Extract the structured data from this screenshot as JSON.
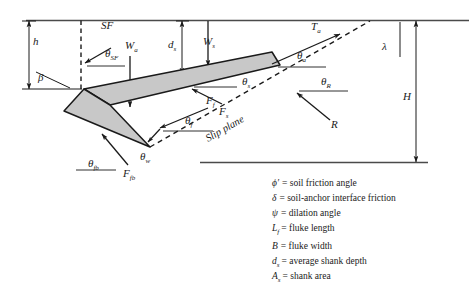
{
  "figure": {
    "title_hidden": "",
    "colors": {
      "anchor_fill": "#c8c8c8",
      "line": "#1a1a1a",
      "text": "#1a1a1a",
      "background": "#ffffff"
    },
    "boundaries": {
      "seabed_line_label": "",
      "base_line_label": ""
    },
    "labels": {
      "h": "h",
      "beta": "β",
      "SF": "SF",
      "theta_SF": "θ",
      "theta_SF_sub": "SF",
      "W_a": "W",
      "W_a_sub": "a",
      "d_s": "d",
      "d_s_sub": "s",
      "W_s": "W",
      "W_s_sub": "s",
      "T_a": "T",
      "T_a_sub": "a",
      "theta_a": "θ",
      "theta_a_sub": "a",
      "lambda": "λ",
      "H": "H",
      "F_f": "F",
      "F_f_sub": "f",
      "theta_f": "θ",
      "theta_f_sub": "f",
      "F_s": "F",
      "F_s_sub": "s",
      "theta_s": "θ",
      "theta_s_sub": "s",
      "theta_R": "θ",
      "theta_R_sub": "R",
      "R": "R",
      "theta_fb": "θ",
      "theta_fb_sub": "fb",
      "F_fb": "F",
      "F_fb_sub": "fb",
      "theta_w": "θ",
      "theta_w_sub": "w",
      "slip_plane": "Slip plane"
    }
  },
  "legend": {
    "items": [
      {
        "symbol": "ϕ′",
        "sub": "",
        "definition": "= soil friction angle"
      },
      {
        "symbol": "δ",
        "sub": "",
        "definition": "= soil-anchor interface friction"
      },
      {
        "symbol": "ψ",
        "sub": "",
        "definition": "= dilation angle"
      },
      {
        "symbol": "L",
        "sub": "f",
        "definition": "= fluke length"
      },
      {
        "symbol": "B",
        "sub": "",
        "definition": "= fluke width"
      },
      {
        "symbol": "d",
        "sub": "s",
        "definition": "= average shank depth"
      },
      {
        "symbol": "A",
        "sub": "s",
        "definition": "= shank area"
      }
    ]
  }
}
